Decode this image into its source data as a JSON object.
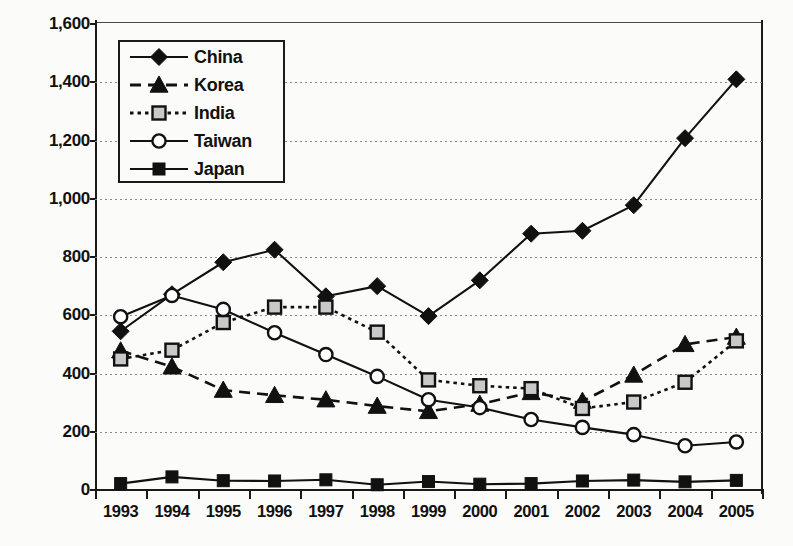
{
  "chart_data": {
    "type": "line",
    "title": "",
    "xlabel": "",
    "ylabel": "",
    "x": [
      1993,
      1994,
      1995,
      1996,
      1997,
      1998,
      1999,
      2000,
      2001,
      2002,
      2003,
      2004,
      2005
    ],
    "categories": [
      "1993",
      "1994",
      "1995",
      "1996",
      "1997",
      "1998",
      "1999",
      "2000",
      "2001",
      "2002",
      "2003",
      "2004",
      "2005"
    ],
    "ylim": [
      0,
      1600
    ],
    "yticks": [
      0,
      200,
      400,
      600,
      800,
      1000,
      1200,
      1400,
      1600
    ],
    "ytick_labels": [
      "0",
      "200",
      "400",
      "600",
      "800",
      "1,000",
      "1,200",
      "1,400",
      "1,600"
    ],
    "grid": "horizontal-dotted",
    "legend_position": "upper-left-inside",
    "series": [
      {
        "name": "China",
        "marker": "filled-diamond",
        "line": "solid",
        "color": "#111111",
        "values": [
          545,
          672,
          782,
          825,
          665,
          700,
          597,
          720,
          880,
          890,
          978,
          1208,
          1410
        ]
      },
      {
        "name": "Korea",
        "marker": "filled-triangle",
        "line": "dashed",
        "color": "#111111",
        "values": [
          478,
          423,
          343,
          325,
          310,
          288,
          270,
          295,
          335,
          305,
          395,
          500,
          525
        ]
      },
      {
        "name": "India",
        "marker": "open-square",
        "line": "dotted",
        "color": "#111111",
        "values": [
          450,
          480,
          575,
          628,
          628,
          542,
          378,
          358,
          348,
          280,
          302,
          370,
          512
        ]
      },
      {
        "name": "Taiwan",
        "marker": "open-circle",
        "line": "solid",
        "color": "#111111",
        "values": [
          595,
          668,
          620,
          540,
          465,
          390,
          310,
          283,
          242,
          215,
          190,
          152,
          165
        ]
      },
      {
        "name": "Japan",
        "marker": "filled-square",
        "line": "solid",
        "color": "#111111",
        "values": [
          22,
          45,
          32,
          31,
          35,
          18,
          29,
          20,
          22,
          31,
          34,
          28,
          33
        ]
      }
    ]
  }
}
